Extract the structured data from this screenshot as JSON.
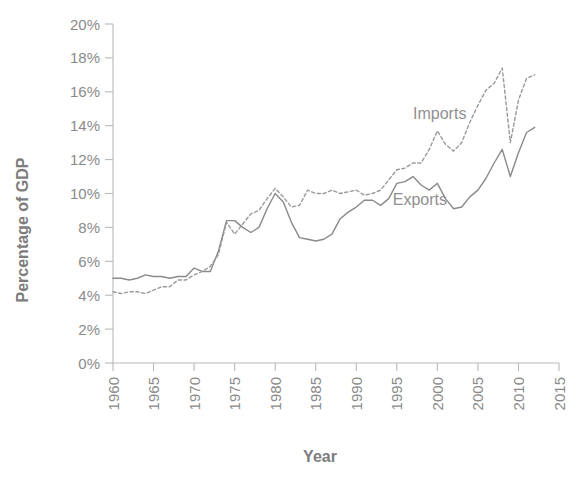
{
  "chart_data": {
    "type": "line",
    "title": "",
    "xlabel": "Year",
    "ylabel": "Percentage of GDP",
    "xlim": [
      1960,
      2015
    ],
    "ylim": [
      0,
      20
    ],
    "grid": false,
    "legend_position": "inline-annotations",
    "x_ticks": [
      "1960",
      "1965",
      "1970",
      "1975",
      "1980",
      "1985",
      "1990",
      "1995",
      "2000",
      "2005",
      "2010",
      "2015"
    ],
    "x_tick_values": [
      1960,
      1965,
      1970,
      1975,
      1980,
      1985,
      1990,
      1995,
      2000,
      2005,
      2010,
      2015
    ],
    "y_ticks": [
      "0%",
      "2%",
      "4%",
      "6%",
      "8%",
      "10%",
      "12%",
      "14%",
      "16%",
      "18%",
      "20%"
    ],
    "y_tick_values": [
      0,
      2,
      4,
      6,
      8,
      10,
      12,
      14,
      16,
      18,
      20
    ],
    "x": [
      1960,
      1961,
      1962,
      1963,
      1964,
      1965,
      1966,
      1967,
      1968,
      1969,
      1970,
      1971,
      1972,
      1973,
      1974,
      1975,
      1976,
      1977,
      1978,
      1979,
      1980,
      1981,
      1982,
      1983,
      1984,
      1985,
      1986,
      1987,
      1988,
      1989,
      1990,
      1991,
      1992,
      1993,
      1994,
      1995,
      1996,
      1997,
      1998,
      1999,
      2000,
      2001,
      2002,
      2003,
      2004,
      2005,
      2006,
      2007,
      2008,
      2009,
      2010,
      2011,
      2012
    ],
    "series": [
      {
        "name": "Exports",
        "style": "solid",
        "color": "#8a8a8a",
        "values": [
          5.0,
          5.0,
          4.9,
          5.0,
          5.2,
          5.1,
          5.1,
          5.0,
          5.1,
          5.1,
          5.6,
          5.4,
          5.4,
          6.6,
          8.4,
          8.4,
          8.0,
          7.7,
          8.0,
          9.1,
          10.0,
          9.5,
          8.3,
          7.4,
          7.3,
          7.2,
          7.3,
          7.6,
          8.5,
          8.9,
          9.2,
          9.6,
          9.6,
          9.3,
          9.7,
          10.6,
          10.7,
          11.0,
          10.5,
          10.2,
          10.6,
          9.7,
          9.1,
          9.2,
          9.8,
          10.2,
          10.9,
          11.8,
          12.6,
          11.0,
          12.4,
          13.6,
          13.9
        ]
      },
      {
        "name": "Imports",
        "style": "dashed",
        "color": "#9a9a9a",
        "values": [
          4.2,
          4.1,
          4.2,
          4.2,
          4.1,
          4.3,
          4.5,
          4.5,
          4.9,
          4.9,
          5.2,
          5.4,
          5.7,
          6.4,
          8.3,
          7.6,
          8.2,
          8.8,
          9.0,
          9.7,
          10.3,
          9.8,
          9.2,
          9.3,
          10.2,
          10.0,
          10.0,
          10.2,
          10.0,
          10.1,
          10.2,
          9.9,
          10.0,
          10.2,
          10.8,
          11.4,
          11.5,
          11.8,
          11.8,
          12.6,
          13.7,
          12.9,
          12.5,
          13.0,
          14.2,
          15.2,
          16.1,
          16.5,
          17.4,
          13.0,
          15.5,
          16.8,
          17.0
        ]
      }
    ],
    "annotations": [
      {
        "text": "Imports",
        "x_value": 1997.0,
        "y_value": 14.4
      },
      {
        "text": "Exports",
        "x_value": 1994.5,
        "y_value": 9.3
      }
    ]
  },
  "colors": {
    "background": "#ffffff",
    "axis": "#b9b9b9",
    "tick_text": "#8a8a8a",
    "title_text": "#7d7d7d",
    "exports_line": "#8a8a8a",
    "imports_line": "#9a9a9a"
  }
}
